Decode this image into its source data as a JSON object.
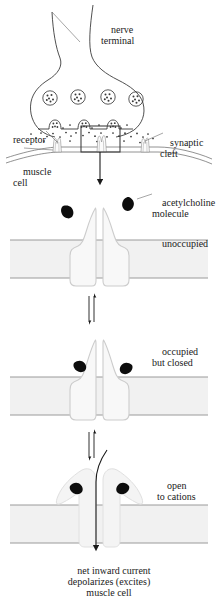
{
  "figure": {
    "colors": {
      "ink": "#1a1a1a",
      "membrane_fill": "#f1f1f1",
      "membrane_line": "#9a9a9a",
      "channel_fill": "#f7f7f7",
      "channel_line": "#cfcfcf",
      "ach_fill": "#0d0d0d",
      "background": "#ffffff"
    }
  },
  "labels": {
    "nerve_terminal": "nerve\nterminal",
    "synaptic_cleft": "synaptic\ncleft",
    "receptor": "receptor",
    "muscle_cell": "muscle\ncell",
    "acetylcholine_molecule": "acetylcholine\nmolecule",
    "unoccupied": "unoccupied",
    "occupied_but_closed": "occupied\nbut closed",
    "open_to_cations": "open\nto cations",
    "caption": "net inward current\ndepolarizes (excites)\nmuscle cell"
  },
  "panels": [
    {
      "id": "synapse-overview",
      "name": "synapse-overview",
      "state_label": "",
      "vesicle_count": 4,
      "fusing_vesicle_count": 3,
      "receptor_count": 3,
      "inset_box": true
    },
    {
      "id": "state-unoccupied",
      "name": "unoccupied-channel",
      "state_label": "unoccupied",
      "ach_bound": 0,
      "ach_free": 2,
      "pore_open": false
    },
    {
      "id": "state-occupied-closed",
      "name": "occupied-but-closed-channel",
      "state_label": "occupied\nbut closed",
      "ach_bound": 2,
      "ach_free": 0,
      "pore_open": false
    },
    {
      "id": "state-open",
      "name": "open-channel",
      "state_label": "open\nto cations",
      "ach_bound": 2,
      "ach_free": 0,
      "pore_open": true
    }
  ],
  "arrows": {
    "inset_to_detail": "downward-arrow",
    "equilibrium_1": "double-headed-equilibrium-arrow",
    "equilibrium_2": "double-headed-equilibrium-arrow",
    "ion_flow": "downward-current-arrow"
  },
  "icons": {
    "vesicle": "synaptic-vesicle-icon",
    "ach": "acetylcholine-molecule-icon",
    "receptor": "acetylcholine-receptor-icon"
  }
}
